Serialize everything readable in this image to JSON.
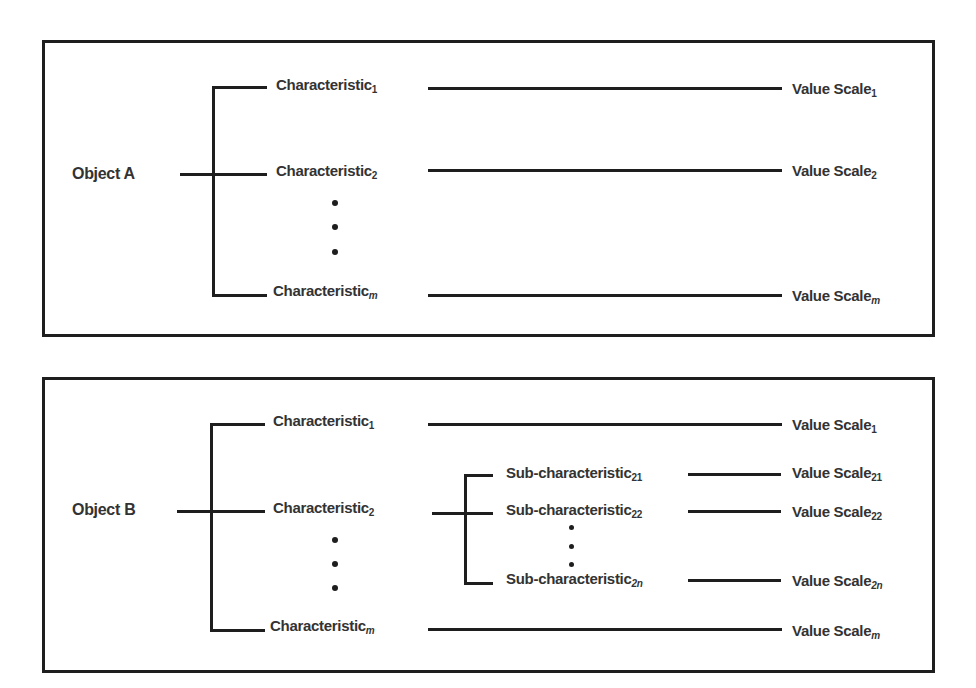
{
  "colors": {
    "line": "#1e1e1e",
    "text": "#333333",
    "background": "#ffffff"
  },
  "diagram_a": {
    "object": "Object A",
    "characteristics": [
      {
        "label": "Characteristic",
        "sub": "1",
        "value": "Value Scale",
        "value_sub": "1"
      },
      {
        "label": "Characteristic",
        "sub": "2",
        "value": "Value Scale",
        "value_sub": "2"
      },
      {
        "label": "Characteristic",
        "sub": "m",
        "value": "Value Scale",
        "value_sub": "m"
      }
    ],
    "ellipsis": "⋮"
  },
  "diagram_b": {
    "object": "Object B",
    "characteristics": [
      {
        "label": "Characteristic",
        "sub": "1",
        "value": "Value Scale",
        "value_sub": "1"
      },
      {
        "label": "Characteristic",
        "sub": "2"
      },
      {
        "label": "Characteristic",
        "sub": "m",
        "value": "Value Scale",
        "value_sub": "m"
      }
    ],
    "sub_characteristics": [
      {
        "label": "Sub-characteristic",
        "sub": "21",
        "value": "Value Scale",
        "value_sub": "21"
      },
      {
        "label": "Sub-characteristic",
        "sub": "22",
        "value": "Value Scale",
        "value_sub": "22"
      },
      {
        "label": "Sub-characteristic",
        "sub": "2n",
        "value": "Value Scale",
        "value_sub": "2n"
      }
    ],
    "ellipsis": "⋮"
  }
}
